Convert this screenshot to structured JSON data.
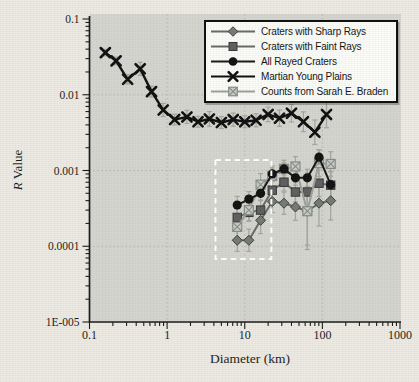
{
  "figure": {
    "background": "#eceae2",
    "plot_background": "#d5d5d0",
    "grid_color": "#b7b7b0",
    "axis_color": "#1a1a1a",
    "tick_label_color": "#1c1c1c",
    "error_bar_color": "#a5a59e",
    "selection_box_color": "#ffffff"
  },
  "chart_data": {
    "type": "line",
    "title": "",
    "xlabel": "Diameter (km)",
    "ylabel": "R Value",
    "ylabel_italic": "R",
    "ylabel_rest": " Value",
    "xscale": "log",
    "yscale": "log",
    "xlim": [
      0.1,
      1000
    ],
    "ylim": [
      1e-05,
      0.1
    ],
    "x_ticks": [
      "0.1",
      "1",
      "10",
      "100",
      "1000"
    ],
    "y_ticks": [
      "0.1",
      "0.01",
      "0.001",
      "0.0001",
      "1E-005"
    ],
    "grid": true,
    "grid_x": [
      1,
      10,
      100
    ],
    "grid_y": [
      0.01,
      0.001,
      0.0001
    ],
    "legend_position": "top-right",
    "series": [
      {
        "name": "Craters with Sharp Rays",
        "marker": "diamond",
        "color": "#646a64",
        "fill": "#747a74",
        "edge": "#3c3c3c",
        "x": [
          8,
          11.3,
          16,
          22.6,
          32,
          45,
          64,
          90.5,
          128
        ],
        "y": [
          0.00012,
          0.00012,
          0.00022,
          0.00039,
          0.00037,
          0.00033,
          0.00029,
          0.00037,
          0.0004
        ],
        "err": [
          1.4,
          1.4,
          1.5,
          1.4,
          1.4,
          1.5,
          2.8,
          2.0,
          1.8
        ]
      },
      {
        "name": "Craters with Faint Rays",
        "marker": "square",
        "color": "#6a6a6a",
        "fill": "#5f5f5f",
        "edge": "#383838",
        "x": [
          8,
          11.3,
          16,
          22.6,
          32,
          45,
          64,
          90.5,
          128
        ],
        "y": [
          0.00024,
          0.00028,
          0.0003,
          0.00055,
          0.0007,
          0.00052,
          0.00052,
          0.00068,
          0.00064
        ],
        "err": [
          1.35,
          1.3,
          1.35,
          1.3,
          1.3,
          1.35,
          1.6,
          1.5,
          1.5
        ]
      },
      {
        "name": "All Rayed Craters",
        "marker": "circle",
        "color": "#161616",
        "fill": "#111111",
        "edge": "#000000",
        "x": [
          8,
          11.3,
          16,
          22.6,
          32,
          45,
          64,
          90.5,
          128
        ],
        "y": [
          0.00035,
          0.00042,
          0.0005,
          0.0009,
          0.00105,
          0.0008,
          0.0008,
          0.0015,
          0.00065
        ],
        "err": [
          1.3,
          1.25,
          1.25,
          1.2,
          1.2,
          1.25,
          1.3,
          1.25,
          1.5
        ]
      },
      {
        "name": "Martian Young Plains",
        "marker": "x",
        "color": "#0f0f0f",
        "fill": "#0f0f0f",
        "edge": "#0f0f0f",
        "x": [
          0.16,
          0.22,
          0.31,
          0.45,
          0.63,
          0.89,
          1.25,
          1.8,
          2.5,
          3.5,
          5,
          7.1,
          10,
          14,
          20,
          28,
          40,
          57,
          80,
          113
        ],
        "y": [
          0.036,
          0.028,
          0.016,
          0.022,
          0.011,
          0.0063,
          0.0047,
          0.0051,
          0.0044,
          0.0048,
          0.0043,
          0.0047,
          0.0044,
          0.0046,
          0.0055,
          0.0049,
          0.0057,
          0.0044,
          0.0032,
          0.0055
        ],
        "err": [
          1.1,
          1.12,
          1.15,
          1.22,
          1.18,
          1.22,
          1.18,
          1.22,
          1.18,
          1.25,
          1.2,
          1.22,
          1.2,
          1.22,
          1.25,
          1.28,
          1.3,
          1.35,
          1.45,
          1.5
        ]
      },
      {
        "name": "Counts from Sarah E. Braden",
        "marker": "crossed-square",
        "color": "#9aa09a",
        "fill": "#c9cdc8",
        "edge": "#878d87",
        "x": [
          8,
          11.3,
          16,
          22.6,
          32,
          45,
          64,
          90.5,
          128
        ],
        "y": [
          0.00018,
          0.0003,
          0.00065,
          0.00085,
          0.00105,
          0.00113,
          0.00029,
          0.00125,
          0.00122
        ],
        "err": [
          1.5,
          1.4,
          1.4,
          1.35,
          1.3,
          1.35,
          3.2,
          1.5,
          1.45
        ]
      }
    ],
    "annotation_box": {
      "x": [
        4.2,
        22
      ],
      "y": [
        6.8e-05,
        0.00138
      ]
    }
  }
}
